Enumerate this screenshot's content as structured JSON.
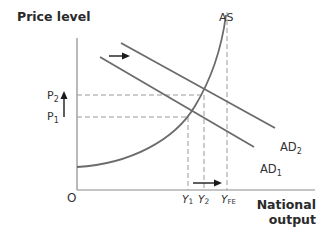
{
  "diagram": {
    "axes": {
      "y_label": "Price level",
      "x_label_line1": "National",
      "x_label_line2": "output",
      "origin_label": "O"
    },
    "curves": {
      "as_label": "AS",
      "ad1_label_main": "AD",
      "ad1_label_sub": "1",
      "ad2_label_main": "AD",
      "ad2_label_sub": "2"
    },
    "price_levels": {
      "p1_main": "P",
      "p1_sub": "1",
      "p2_main": "P",
      "p2_sub": "2"
    },
    "output_levels": {
      "y1_main": "Y",
      "y1_sub": "1",
      "y2_main": "Y",
      "y2_sub": "2",
      "yfe_main": "Y",
      "yfe_sub": "FE"
    },
    "colors": {
      "curve": "#6b6b6b",
      "axis": "#8a8a8a",
      "dashed": "#9a9a9a",
      "arrow": "#1a1a1a",
      "text": "#333333"
    }
  }
}
